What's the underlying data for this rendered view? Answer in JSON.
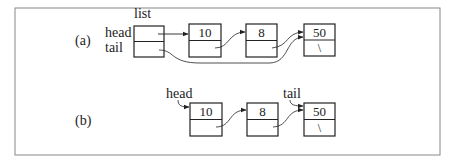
{
  "diagram": {
    "part_a": {
      "label": "(a)",
      "list_struct": {
        "name": "list",
        "fields": [
          "head",
          "tail"
        ]
      },
      "nodes": [
        {
          "value": "10",
          "next": ""
        },
        {
          "value": "8",
          "next": ""
        },
        {
          "value": "50",
          "next": "\\"
        }
      ]
    },
    "part_b": {
      "label": "(b)",
      "head_label": "head",
      "tail_label": "tail",
      "nodes": [
        {
          "value": "10",
          "next": ""
        },
        {
          "value": "8",
          "next": ""
        },
        {
          "value": "50",
          "next": "\\"
        }
      ]
    },
    "colors": {
      "stroke": "#222222",
      "frame": "#888888"
    }
  }
}
